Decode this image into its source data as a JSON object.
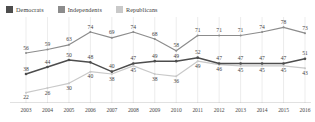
{
  "legend": {
    "position": "top-left",
    "items": [
      {
        "label": "Democrats",
        "color": "#4d4d4d"
      },
      {
        "label": "Independents",
        "color": "#8c8c8c"
      },
      {
        "label": "Republicans",
        "color": "#c9c9c9"
      }
    ]
  },
  "chart_data": {
    "type": "line",
    "title": "",
    "subtitle": "",
    "xlabel": "",
    "ylabel": "",
    "grid": true,
    "ylim": [
      20,
      80
    ],
    "legend_position": "top-left",
    "categories": [
      "2003",
      "2004",
      "2005",
      "2006",
      "2007",
      "2008",
      "2009",
      "2010",
      "2011",
      "2012",
      "2013",
      "2014",
      "2015",
      "2016"
    ],
    "series": [
      {
        "name": "Democrats",
        "color": "#8c8c8c",
        "values": [
          56,
          59,
          63,
          74,
          69,
          74,
          68,
          58,
          71,
          71,
          71,
          74,
          78,
          73
        ]
      },
      {
        "name": "Independents",
        "color": "#4d4d4d",
        "values": [
          38,
          44,
          50,
          48,
          40,
          47,
          49,
          49,
          52,
          47,
          47,
          47,
          47,
          51
        ]
      },
      {
        "name": "Republicans",
        "color": "#c9c9c9",
        "values": [
          22,
          26,
          30,
          40,
          38,
          45,
          38,
          36,
          49,
          46,
          45,
          45,
          45,
          43
        ]
      }
    ],
    "point_labels": {
      "Democrats": [
        "56",
        "59",
        "63",
        "74",
        "69",
        "74",
        "68",
        "58",
        "71",
        "71",
        "71",
        "74",
        "78",
        "73"
      ],
      "Independents": [
        "38",
        "44",
        "50",
        "48",
        "40",
        "47",
        "49",
        "49",
        "52",
        "47",
        "47",
        "47",
        "47",
        "51"
      ],
      "Republicans": [
        "22",
        "26",
        "30",
        "40",
        "38",
        "45",
        "38",
        "36",
        "49",
        "46",
        "45",
        "45",
        "45",
        "43"
      ]
    }
  }
}
